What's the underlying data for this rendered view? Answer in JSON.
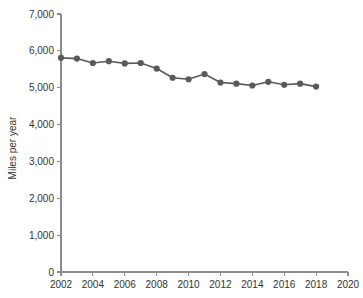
{
  "chart_data": {
    "type": "line",
    "title": "",
    "subtitle": "",
    "xlabel": "",
    "ylabel": "Miles per year",
    "xlim": [
      2002,
      2020
    ],
    "ylim": [
      0,
      7000
    ],
    "grid": false,
    "legend": null,
    "x": [
      2002,
      2003,
      2004,
      2005,
      2006,
      2007,
      2008,
      2009,
      2010,
      2011,
      2012,
      2013,
      2014,
      2015,
      2016,
      2017,
      2018
    ],
    "series": [
      {
        "name": "Miles per year",
        "color": "#5a5a5a",
        "values": [
          5810,
          5790,
          5670,
          5720,
          5660,
          5670,
          5520,
          5270,
          5230,
          5370,
          5140,
          5110,
          5060,
          5160,
          5080,
          5110,
          5030
        ]
      }
    ],
    "x_tick_labels": [
      "2002",
      "2004",
      "2006",
      "2008",
      "2010",
      "2012",
      "2014",
      "2016",
      "2018",
      "2020"
    ],
    "x_tick_values": [
      2002,
      2004,
      2006,
      2008,
      2010,
      2012,
      2014,
      2016,
      2018,
      2020
    ],
    "y_tick_labels": [
      "0",
      "1,000",
      "2,000",
      "3,000",
      "4,000",
      "5,000",
      "6,000",
      "7,000"
    ],
    "y_tick_values": [
      0,
      1000,
      2000,
      3000,
      4000,
      5000,
      6000,
      7000
    ],
    "colors": {
      "series": "#5a5a5a",
      "axis": "#8c8c8c",
      "text": "#333333",
      "background": "#ffffff"
    }
  }
}
